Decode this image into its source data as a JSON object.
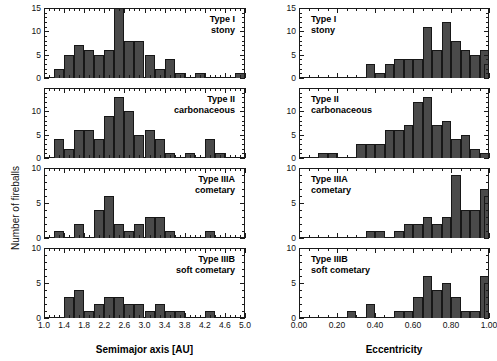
{
  "figure": {
    "ylabel": "Number of fireballs",
    "columns": [
      {
        "xlabel": "Semimajor axis [AU]"
      },
      {
        "xlabel": "Eccentricity"
      }
    ]
  },
  "chart_data": [
    {
      "type": "bar",
      "title": "Type I stony",
      "title_lines": [
        "Type I",
        "stony"
      ],
      "xlabel": "Semimajor axis [AU]",
      "ylabel": "Number of fireballs",
      "xlim": [
        1.0,
        5.0
      ],
      "ylim": [
        0,
        15
      ],
      "xticks": [
        1.0,
        1.4,
        1.8,
        2.2,
        2.6,
        3.0,
        3.4,
        3.8,
        4.2,
        4.6,
        5.0
      ],
      "xticklabels": [
        "1.0",
        "1.4",
        "1.8",
        "2.2",
        "2.6",
        "3.0",
        "3.4",
        "3.8",
        "4.2",
        "4.6",
        "5.0"
      ],
      "yticks": [
        0,
        5,
        10,
        15
      ],
      "yticklabels": [
        "0",
        "5",
        "10",
        "15"
      ],
      "bin_width": 0.2,
      "bin_starts": [
        1.2,
        1.4,
        1.6,
        1.8,
        2.0,
        2.2,
        2.4,
        2.6,
        2.8,
        3.0,
        3.2,
        3.4,
        3.6,
        4.0,
        4.8
      ],
      "values": [
        2,
        5,
        7,
        6,
        5,
        6,
        15,
        8,
        8,
        5,
        2,
        4,
        1,
        1,
        1
      ],
      "grid": false,
      "legend": "none"
    },
    {
      "type": "bar",
      "title": "Type II carbonaceous",
      "title_lines": [
        "Type II",
        "carbonaceous"
      ],
      "xlabel": "Semimajor axis [AU]",
      "ylabel": "Number of fireballs",
      "xlim": [
        1.0,
        5.0
      ],
      "ylim": [
        0,
        15
      ],
      "xticks": [
        1.0,
        1.4,
        1.8,
        2.2,
        2.6,
        3.0,
        3.4,
        3.8,
        4.2,
        4.6,
        5.0
      ],
      "xticklabels": [
        "1.0",
        "1.4",
        "1.8",
        "2.2",
        "2.6",
        "3.0",
        "3.4",
        "3.8",
        "4.2",
        "4.6",
        "5.0"
      ],
      "yticks": [
        0,
        5,
        10
      ],
      "yticklabels": [
        "0",
        "5",
        "10"
      ],
      "bin_width": 0.2,
      "bin_starts": [
        1.2,
        1.4,
        1.6,
        1.8,
        2.0,
        2.2,
        2.4,
        2.6,
        2.8,
        3.0,
        3.2,
        3.4,
        3.8,
        4.2,
        4.4
      ],
      "values": [
        4,
        2,
        6,
        6,
        4,
        9,
        13,
        10,
        5,
        6,
        4,
        1,
        1,
        4,
        1
      ],
      "grid": false,
      "legend": "none"
    },
    {
      "type": "bar",
      "title": "Type IIIA cometary",
      "title_lines": [
        "Type IIIA",
        "cometary"
      ],
      "xlabel": "Semimajor axis [AU]",
      "ylabel": "Number of fireballs",
      "xlim": [
        1.0,
        5.0
      ],
      "ylim": [
        0,
        10
      ],
      "xticks": [
        1.0,
        1.4,
        1.8,
        2.2,
        2.6,
        3.0,
        3.4,
        3.8,
        4.2,
        4.6,
        5.0
      ],
      "xticklabels": [
        "1.0",
        "1.4",
        "1.8",
        "2.2",
        "2.6",
        "3.0",
        "3.4",
        "3.8",
        "4.2",
        "4.6",
        "5.0"
      ],
      "yticks": [
        0,
        5,
        10
      ],
      "yticklabels": [
        "0",
        "5",
        "10"
      ],
      "bin_width": 0.2,
      "bin_starts": [
        1.2,
        1.6,
        2.0,
        2.2,
        2.4,
        2.6,
        2.8,
        3.0,
        3.2,
        3.4,
        4.2
      ],
      "values": [
        1,
        2,
        4,
        6,
        2,
        1,
        2,
        3,
        3,
        1,
        1
      ],
      "grid": false,
      "legend": "none"
    },
    {
      "type": "bar",
      "title": "Type IIIB soft cometary",
      "title_lines": [
        "Type IIIB",
        "soft cometary"
      ],
      "xlabel": "Semimajor axis [AU]",
      "ylabel": "Number of fireballs",
      "xlim": [
        1.0,
        5.0
      ],
      "ylim": [
        0,
        10
      ],
      "xticks": [
        1.0,
        1.4,
        1.8,
        2.2,
        2.6,
        3.0,
        3.4,
        3.8,
        4.2,
        4.6,
        5.0
      ],
      "xticklabels": [
        "1.0",
        "1.4",
        "1.8",
        "2.2",
        "2.6",
        "3.0",
        "3.4",
        "3.8",
        "4.2",
        "4.6",
        "5.0"
      ],
      "yticks": [
        0,
        5,
        10
      ],
      "yticklabels": [
        "0",
        "5",
        "10"
      ],
      "bin_width": 0.2,
      "bin_starts": [
        1.4,
        1.6,
        1.8,
        2.0,
        2.2,
        2.4,
        2.6,
        2.8,
        3.0,
        3.2,
        3.4,
        3.6,
        4.2
      ],
      "values": [
        3,
        4,
        1,
        2,
        3,
        3,
        2,
        2,
        1,
        2,
        1,
        1,
        1
      ],
      "grid": false,
      "legend": "none"
    },
    {
      "type": "bar",
      "title": "Type I stony",
      "title_lines": [
        "Type I",
        "stony"
      ],
      "xlabel": "Eccentricity",
      "ylabel": "Number of fireballs",
      "xlim": [
        0.0,
        1.0
      ],
      "ylim": [
        0,
        15
      ],
      "xticks": [
        0.0,
        0.2,
        0.4,
        0.6,
        0.8,
        1.0
      ],
      "xticklabels": [
        "0.00",
        "0.20",
        "0.40",
        "0.60",
        "0.80",
        "1.00"
      ],
      "yticks": [
        0,
        5,
        10,
        15
      ],
      "yticklabels": [
        "0",
        "5",
        "10",
        "15"
      ],
      "bin_width": 0.05,
      "bin_starts": [
        0.35,
        0.4,
        0.45,
        0.5,
        0.55,
        0.6,
        0.65,
        0.7,
        0.75,
        0.8,
        0.85,
        0.9,
        0.95
      ],
      "values": [
        3,
        1,
        3,
        4,
        4,
        4,
        11,
        6,
        12,
        8,
        6,
        5,
        6
      ],
      "last_bar_value": 3,
      "grid": false,
      "legend": "none"
    },
    {
      "type": "bar",
      "title": "Type II carbonaceous",
      "title_lines": [
        "Type II",
        "carbonaceous"
      ],
      "xlabel": "Eccentricity",
      "ylabel": "Number of fireballs",
      "xlim": [
        0.0,
        1.0
      ],
      "ylim": [
        0,
        15
      ],
      "xticks": [
        0.0,
        0.2,
        0.4,
        0.6,
        0.8,
        1.0
      ],
      "xticklabels": [
        "0.00",
        "0.20",
        "0.40",
        "0.60",
        "0.80",
        "1.00"
      ],
      "yticks": [
        0,
        5,
        10
      ],
      "yticklabels": [
        "0",
        "5",
        "10"
      ],
      "bin_width": 0.05,
      "bin_starts": [
        0.1,
        0.15,
        0.3,
        0.35,
        0.4,
        0.45,
        0.5,
        0.55,
        0.6,
        0.65,
        0.7,
        0.75,
        0.8,
        0.85,
        0.9,
        0.95
      ],
      "values": [
        1,
        1,
        3,
        3,
        3,
        6,
        6,
        7,
        12,
        13,
        7,
        8,
        4,
        5,
        2,
        1
      ],
      "grid": false,
      "legend": "none"
    },
    {
      "type": "bar",
      "title": "Type IIIA cometary",
      "title_lines": [
        "Type IIIA",
        "cometary"
      ],
      "xlabel": "Eccentricity",
      "ylabel": "Number of fireballs",
      "xlim": [
        0.0,
        1.0
      ],
      "ylim": [
        0,
        10
      ],
      "xticks": [
        0.0,
        0.2,
        0.4,
        0.6,
        0.8,
        1.0
      ],
      "xticklabels": [
        "0.00",
        "0.20",
        "0.40",
        "0.60",
        "0.80",
        "1.00"
      ],
      "yticks": [
        0,
        5,
        10
      ],
      "yticklabels": [
        "0",
        "5",
        "10"
      ],
      "bin_width": 0.05,
      "bin_starts": [
        0.35,
        0.4,
        0.5,
        0.55,
        0.6,
        0.65,
        0.7,
        0.75,
        0.8,
        0.85,
        0.9,
        0.95
      ],
      "values": [
        1,
        1,
        1,
        2,
        2,
        3,
        2,
        3,
        9,
        4,
        4,
        7
      ],
      "last_bar_value": 6,
      "grid": false,
      "legend": "none"
    },
    {
      "type": "bar",
      "title": "Type IIIB soft cometary",
      "title_lines": [
        "Type IIIB",
        "soft cometary"
      ],
      "xlabel": "Eccentricity",
      "ylabel": "Number of fireballs",
      "xlim": [
        0.0,
        1.0
      ],
      "ylim": [
        0,
        10
      ],
      "xticks": [
        0.0,
        0.2,
        0.4,
        0.6,
        0.8,
        1.0
      ],
      "xticklabels": [
        "0.00",
        "0.20",
        "0.40",
        "0.60",
        "0.80",
        "1.00"
      ],
      "yticks": [
        0,
        5,
        10
      ],
      "yticklabels": [
        "0",
        "5",
        "10"
      ],
      "bin_width": 0.05,
      "bin_starts": [
        0.25,
        0.35,
        0.5,
        0.55,
        0.6,
        0.65,
        0.7,
        0.75,
        0.8,
        0.85,
        0.9,
        0.95
      ],
      "values": [
        1,
        2,
        1,
        1,
        3,
        6,
        4,
        5,
        3,
        1,
        1,
        6
      ],
      "last_bar_value": 5,
      "grid": false,
      "legend": "none"
    }
  ]
}
